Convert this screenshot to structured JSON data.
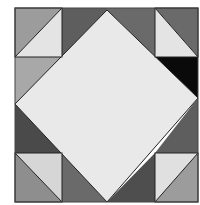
{
  "figure": {
    "colors": {
      "background": "#ffffff",
      "light": "#e4e4e4",
      "center": "#e9e9e9",
      "mid_gray": "#9c9c9c",
      "dark_gray": "#5e5e5e",
      "black": "#0a0a0a",
      "outline": "#222222"
    },
    "block": {
      "x": 15,
      "y": 8,
      "w": 183,
      "h": 194
    },
    "center_diamond": {
      "top": [
        107,
        10
      ],
      "right": [
        198,
        98
      ],
      "bottom": [
        107,
        202
      ],
      "left": [
        15,
        104
      ]
    },
    "corner_squares": [
      {
        "name": "top-left",
        "x": 15,
        "y": 8,
        "w": 47,
        "h": 49,
        "upper_fill": "mid_gray",
        "lower_fill": "light"
      },
      {
        "name": "top-right",
        "x": 155,
        "y": 8,
        "w": 43,
        "h": 49,
        "upper_fill": "dark_gray",
        "lower_fill": "light"
      },
      {
        "name": "bottom-left",
        "x": 15,
        "y": 153,
        "w": 47,
        "h": 49,
        "upper_fill": "light",
        "lower_fill": "mid_gray"
      },
      {
        "name": "bottom-right",
        "x": 155,
        "y": 153,
        "w": 43,
        "h": 49,
        "upper_fill": "light",
        "lower_fill": "mid_gray"
      }
    ]
  }
}
